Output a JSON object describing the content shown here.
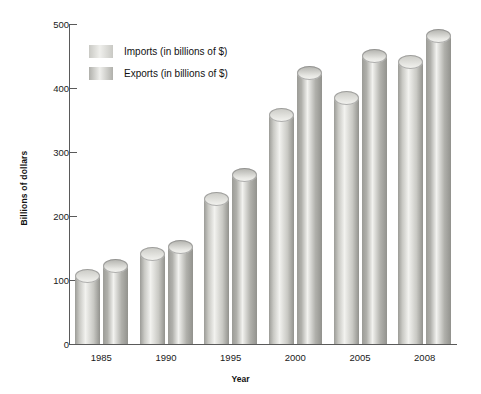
{
  "chart_data": {
    "type": "bar",
    "title": "",
    "xlabel": "Year",
    "ylabel": "Billions of dollars",
    "categories": [
      "1985",
      "1990",
      "1995",
      "2000",
      "2005",
      "2008"
    ],
    "series": [
      {
        "name": "Imports (in billions of $)",
        "values": [
          107,
          140,
          227,
          358,
          385,
          440
        ],
        "color": "#c9c9c4"
      },
      {
        "name": "Exports (in billions of $)",
        "values": [
          122,
          151,
          264,
          424,
          450,
          481
        ],
        "color": "#b0b0ab"
      }
    ],
    "ylim": [
      0,
      500
    ],
    "yticks": [
      0,
      100,
      200,
      300,
      400,
      500
    ],
    "ytick_labels": [
      "0",
      "100",
      "200",
      "300",
      "400",
      "500"
    ],
    "grid": false,
    "legend_position": "top-left"
  },
  "legend": {
    "entries": [
      {
        "label": "Imports (in billions of $)",
        "swatch": "#c9c9c4"
      },
      {
        "label": "Exports (in billions of $)",
        "swatch": "#b0b0ab"
      }
    ]
  },
  "axes": {
    "y_title": "Billions of dollars",
    "x_title": "Year"
  },
  "caption": {
    "text": ""
  },
  "colors": {
    "axis": "#5a5a5a",
    "text": "#1a1a1a",
    "background": "#ffffff"
  }
}
